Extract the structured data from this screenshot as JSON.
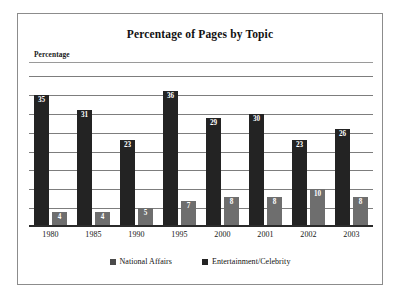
{
  "figure": {
    "title": "Percentage of Pages by Topic",
    "y_axis_caption": "Percentage"
  },
  "legend": {
    "items": [
      {
        "label": "National Affairs",
        "swatch": "legend-swatch-national-affairs"
      },
      {
        "label": "Entertainment/Celebrity",
        "swatch": "legend-swatch-entertainment-celebrity"
      }
    ]
  },
  "chart_data": {
    "type": "bar",
    "title": "Percentage of Pages by Topic",
    "xlabel": "",
    "ylabel": "Percentage",
    "ylim": [
      0,
      40
    ],
    "ytick_interval": 5,
    "yticks": [
      0,
      5,
      10,
      15,
      20,
      25,
      30,
      35,
      40
    ],
    "grid": true,
    "grid_axis": "y",
    "axis_tick_labels_visible": false,
    "data_labels": true,
    "legend_position": "bottom-center",
    "orientation": "vertical",
    "grouping": "grouped",
    "categories": [
      "1980",
      "1985",
      "1990",
      "1995",
      "2000",
      "2001",
      "2002",
      "2003"
    ],
    "series": [
      {
        "name": "National Affairs",
        "color": "#232323",
        "values": [
          35,
          31,
          23,
          36,
          29,
          30,
          23,
          26
        ]
      },
      {
        "name": "Entertainment/Celebrity",
        "color": "#6e6e6e",
        "values": [
          4,
          4,
          5,
          7,
          8,
          8,
          10,
          8
        ]
      }
    ]
  }
}
